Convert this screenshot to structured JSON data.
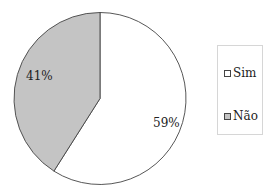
{
  "chart_data": {
    "type": "pie",
    "title": "",
    "categories": [
      "Sim",
      "Não"
    ],
    "values": [
      59,
      41
    ],
    "labels": [
      "59%",
      "41%"
    ],
    "colors": [
      "#ffffff",
      "#c4c4c4"
    ],
    "legend_position": "right",
    "start_angle": "12 o'clock, clockwise"
  },
  "legend": {
    "items": [
      {
        "label": "Sim",
        "color": "#ffffff"
      },
      {
        "label": "Não",
        "color": "#c4c4c4"
      }
    ]
  }
}
